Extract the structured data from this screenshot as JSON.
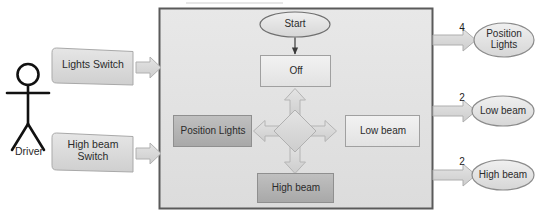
{
  "diagram": {
    "type": "state-machine-context-diagram",
    "actor": {
      "name": "driver-actor",
      "label": "Driver",
      "icon": "stick-figure-icon"
    },
    "inputs": [
      {
        "name": "lights-switch",
        "label": "Lights Switch",
        "shape": "tag"
      },
      {
        "name": "high-beam-switch",
        "label": "High beam\nSwitch",
        "shape": "tag"
      }
    ],
    "system": {
      "name": "system-boundary",
      "start_node": {
        "label": "Start",
        "shape": "ellipse"
      },
      "states": [
        {
          "name": "state-off",
          "label": "Off",
          "fill": "#eeeeee"
        },
        {
          "name": "state-position-lights",
          "label": "Position Lights",
          "fill": "#b4b4b4"
        },
        {
          "name": "state-low-beam",
          "label": "Low beam",
          "fill": "#eaeaea"
        },
        {
          "name": "state-high-beam",
          "label": "High beam",
          "fill": "#b9b9b9"
        }
      ],
      "decision": {
        "name": "decision-diamond",
        "shape": "diamond"
      },
      "transitions": [
        {
          "from": "decision",
          "to": "state-off",
          "direction": "up"
        },
        {
          "from": "decision",
          "to": "state-position-lights",
          "direction": "left"
        },
        {
          "from": "decision",
          "to": "state-low-beam",
          "direction": "right"
        },
        {
          "from": "decision",
          "to": "state-high-beam",
          "direction": "down"
        }
      ]
    },
    "outputs": [
      {
        "name": "output-position-lights",
        "label": "Position\nLights",
        "multiplicity": "4"
      },
      {
        "name": "output-low-beam",
        "label": "Low beam",
        "multiplicity": "2"
      },
      {
        "name": "output-high-beam",
        "label": "High beam",
        "multiplicity": "2"
      }
    ],
    "colors": {
      "boundary_fill": "#e2e2e2",
      "boundary_stroke": "#5a5a5a",
      "shape_stroke": "#9a9a9a",
      "arrow_fill": "#d9d9d9",
      "arrow_stroke": "#a8a8a8",
      "text": "#2b2b2b"
    }
  }
}
